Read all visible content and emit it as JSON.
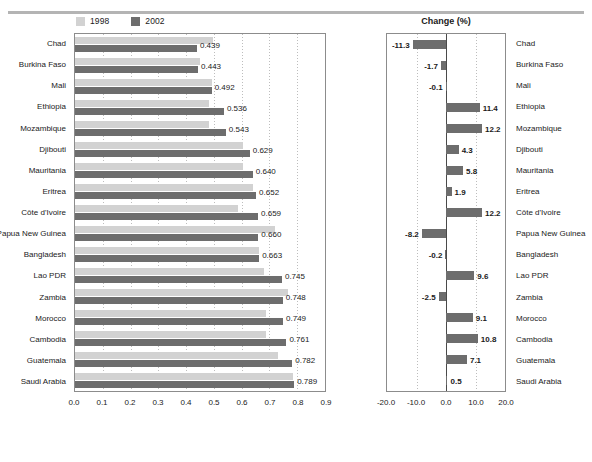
{
  "top_rule": true,
  "legend": {
    "items": [
      {
        "label": "1998",
        "color": "#d2d2d2",
        "name": "legend-1998"
      },
      {
        "label": "2002",
        "color": "#6d6d6d",
        "name": "legend-2002"
      }
    ]
  },
  "right_panel_title": "Change (%)",
  "chart_data": {
    "type": "bar",
    "title": "",
    "orientation": "horizontal",
    "panels": [
      {
        "id": "levels",
        "title": "",
        "xlabel": "",
        "ylabel": "",
        "xlim": [
          0.0,
          0.9
        ],
        "xticks": [
          "0.0",
          "0.1",
          "0.2",
          "0.3",
          "0.4",
          "0.5",
          "0.6",
          "0.7",
          "0.8",
          "0.9"
        ],
        "grid": true,
        "legend_position": "top",
        "series": [
          {
            "name": "1998",
            "color": "#d2d2d2",
            "values": [
              0.495,
              0.451,
              0.492,
              0.481,
              0.484,
              0.603,
              0.605,
              0.64,
              0.587,
              0.719,
              0.664,
              0.68,
              0.767,
              0.687,
              0.687,
              0.73,
              0.785
            ]
          },
          {
            "name": "2002",
            "color": "#6d6d6d",
            "values": [
              0.439,
              0.443,
              0.492,
              0.536,
              0.543,
              0.629,
              0.64,
              0.652,
              0.659,
              0.66,
              0.663,
              0.745,
              0.748,
              0.749,
              0.761,
              0.782,
              0.789
            ]
          }
        ],
        "data_labels": [
          "0.439",
          "0.443",
          "0.492",
          "0.536",
          "0.543",
          "0.629",
          "0.640",
          "0.652",
          "0.659",
          "0.660",
          "0.663",
          "0.745",
          "0.748",
          "0.749",
          "0.761",
          "0.782",
          "0.789"
        ]
      },
      {
        "id": "change",
        "title": "Change (%)",
        "xlabel": "",
        "ylabel": "",
        "xlim": [
          -20.0,
          20.0
        ],
        "xticks": [
          "-20.0",
          "-10.0",
          "0.0",
          "10.0",
          "20.0"
        ],
        "grid": true,
        "color": "#6d6d6d",
        "values": [
          -11.3,
          -1.7,
          -0.1,
          11.4,
          12.2,
          4.3,
          5.8,
          1.9,
          12.2,
          -8.2,
          -0.2,
          9.6,
          -2.5,
          9.1,
          10.8,
          7.1,
          0.5
        ],
        "data_labels": [
          "-11.3",
          "-1.7",
          "-0.1",
          "11.4",
          "12.2",
          "4.3",
          "5.8",
          "1.9",
          "12.2",
          "-8.2",
          "-0.2",
          "9.6",
          "-2.5",
          "9.1",
          "10.8",
          "7.1",
          "0.5"
        ]
      }
    ],
    "categories": [
      "Chad",
      "Burkina Faso",
      "Mali",
      "Ethiopia",
      "Mozambique",
      "Djibouti",
      "Mauritania",
      "Eritrea",
      "Côte d'Ivoire",
      "Papua New Guinea",
      "Bangladesh",
      "Lao PDR",
      "Zambia",
      "Morocco",
      "Cambodia",
      "Guatemala",
      "Saudi Arabia"
    ]
  }
}
